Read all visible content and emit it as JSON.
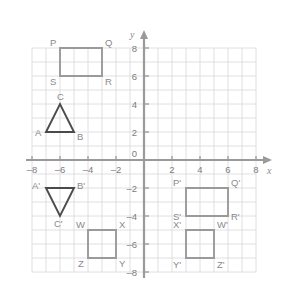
{
  "figure": {
    "title": "",
    "type": "coordinate-plane",
    "background_color": "#ffffff",
    "grid_color": "#d8d8dc",
    "axis_color": "#9a9a9a",
    "shape_color": "#9a9a9a",
    "triangle_color": "#4a4a4a",
    "label_color": "#8a8a8a"
  },
  "axes": {
    "x_label": "x",
    "y_label": "y",
    "origin_label": "0",
    "x_min": -8,
    "x_max": 8,
    "y_min": -8,
    "y_max": 8,
    "unit_px": 14,
    "origin_px": {
      "x": 144,
      "y": 160
    },
    "x_ticks": [
      {
        "value": -8,
        "label": "–8"
      },
      {
        "value": -6,
        "label": "–6"
      },
      {
        "value": -4,
        "label": "–4"
      },
      {
        "value": -2,
        "label": "–2"
      },
      {
        "value": 2,
        "label": "2"
      },
      {
        "value": 4,
        "label": "4"
      },
      {
        "value": 6,
        "label": "6"
      },
      {
        "value": 8,
        "label": "8"
      }
    ],
    "y_ticks": [
      {
        "value": 8,
        "label": "8"
      },
      {
        "value": 6,
        "label": "6"
      },
      {
        "value": 4,
        "label": "4"
      },
      {
        "value": 2,
        "label": "2"
      },
      {
        "value": -2,
        "label": "–2"
      },
      {
        "value": -4,
        "label": "–4"
      },
      {
        "value": -6,
        "label": "–6"
      },
      {
        "value": -8,
        "label": "–8"
      }
    ]
  },
  "chart_data": {
    "type": "scatter",
    "title": "",
    "xlabel": "x",
    "ylabel": "y",
    "xlim": [
      -8,
      8
    ],
    "ylim": [
      -8,
      8
    ],
    "grid": true,
    "legend": "none",
    "shapes": [
      {
        "name": "rectangle-pqrs",
        "kind": "rectangle",
        "stroke": "#9a9a9a",
        "closed": true,
        "vertices": [
          {
            "label": "P",
            "x": -6,
            "y": 8,
            "label_dx": -10,
            "label_dy": -2
          },
          {
            "label": "Q",
            "x": -3,
            "y": 8,
            "label_dx": 3,
            "label_dy": -2
          },
          {
            "label": "R",
            "x": -3,
            "y": 6,
            "label_dx": 3,
            "label_dy": 9
          },
          {
            "label": "S",
            "x": -6,
            "y": 6,
            "label_dx": -10,
            "label_dy": 9
          }
        ]
      },
      {
        "name": "triangle-abc",
        "kind": "triangle",
        "stroke": "#4a4a4a",
        "closed": true,
        "vertices": [
          {
            "label": "A",
            "x": -7,
            "y": 2,
            "label_dx": -11,
            "label_dy": 4
          },
          {
            "label": "B",
            "x": -5,
            "y": 2,
            "label_dx": 3,
            "label_dy": 8
          },
          {
            "label": "C",
            "x": -6,
            "y": 4,
            "label_dx": -3,
            "label_dy": -4
          }
        ]
      },
      {
        "name": "triangle-a-prime-b-prime-c-prime",
        "kind": "triangle",
        "stroke": "#4a4a4a",
        "closed": true,
        "vertices": [
          {
            "label": "A'",
            "x": -7,
            "y": -2,
            "label_dx": -14,
            "label_dy": 1
          },
          {
            "label": "B'",
            "x": -5,
            "y": -2,
            "label_dx": 3,
            "label_dy": 1
          },
          {
            "label": "C'",
            "x": -6,
            "y": -4,
            "label_dx": -6,
            "label_dy": 11
          }
        ]
      },
      {
        "name": "square-wxyz",
        "kind": "square",
        "stroke": "#9a9a9a",
        "closed": true,
        "vertices": [
          {
            "label": "W",
            "x": -4,
            "y": -5,
            "label_dx": -12,
            "label_dy": -2
          },
          {
            "label": "X",
            "x": -2,
            "y": -5,
            "label_dx": 3,
            "label_dy": -2
          },
          {
            "label": "Y",
            "x": -2,
            "y": -7,
            "label_dx": 3,
            "label_dy": 9
          },
          {
            "label": "Z",
            "x": -4,
            "y": -7,
            "label_dx": -10,
            "label_dy": 9
          }
        ]
      },
      {
        "name": "rectangle-p-prime-q-prime-r-prime-s-prime",
        "kind": "rectangle",
        "stroke": "#9a9a9a",
        "closed": true,
        "vertices": [
          {
            "label": "P'",
            "x": 3,
            "y": -2,
            "label_dx": -13,
            "label_dy": -2
          },
          {
            "label": "Q'",
            "x": 6,
            "y": -2,
            "label_dx": 3,
            "label_dy": -2
          },
          {
            "label": "R'",
            "x": 6,
            "y": -4,
            "label_dx": 3,
            "label_dy": 4
          },
          {
            "label": "S'",
            "x": 3,
            "y": -4,
            "label_dx": -13,
            "label_dy": 4
          }
        ]
      },
      {
        "name": "square-x-prime-w-prime-z-prime-y-prime",
        "kind": "square",
        "stroke": "#9a9a9a",
        "closed": true,
        "vertices": [
          {
            "label": "X'",
            "x": 3,
            "y": -5,
            "label_dx": -13,
            "label_dy": -2
          },
          {
            "label": "W'",
            "x": 5,
            "y": -5,
            "label_dx": 3,
            "label_dy": -2
          },
          {
            "label": "Z'",
            "x": 5,
            "y": -7,
            "label_dx": 3,
            "label_dy": 10
          },
          {
            "label": "Y'",
            "x": 3,
            "y": -7,
            "label_dx": -13,
            "label_dy": 10
          }
        ]
      }
    ]
  }
}
